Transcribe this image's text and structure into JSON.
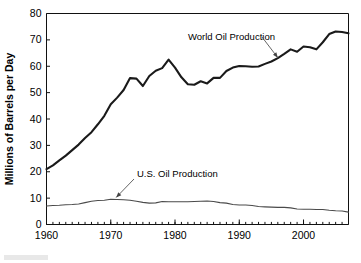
{
  "chart_data": {
    "type": "line",
    "title": "",
    "xlabel": "",
    "ylabel": "Millions of Barrels per Day",
    "xlim": [
      1960,
      2007
    ],
    "ylim": [
      0,
      80
    ],
    "ytick_values": [
      0,
      10,
      20,
      30,
      40,
      50,
      60,
      70,
      80
    ],
    "ytick_labels": [
      "0",
      "10",
      "20",
      "30",
      "40",
      "50",
      "60",
      "70",
      "80"
    ],
    "xtick_values": [
      1960,
      1970,
      1980,
      1990,
      2000
    ],
    "xtick_labels": [
      "1960",
      "1970",
      "1980",
      "1990",
      "2000"
    ],
    "minor_xticks_every": 1,
    "grid": false,
    "legend": "none",
    "x": [
      1960,
      1961,
      1962,
      1963,
      1964,
      1965,
      1966,
      1967,
      1968,
      1969,
      1970,
      1971,
      1972,
      1973,
      1974,
      1975,
      1976,
      1977,
      1978,
      1979,
      1980,
      1981,
      1982,
      1983,
      1984,
      1985,
      1986,
      1987,
      1988,
      1989,
      1990,
      1991,
      1992,
      1993,
      1994,
      1995,
      1996,
      1997,
      1998,
      1999,
      2000,
      2001,
      2002,
      2003,
      2004,
      2005,
      2006,
      2007
    ],
    "series": [
      {
        "name": "World Oil Production",
        "values": [
          21.0,
          22.4,
          24.3,
          26.1,
          28.2,
          30.3,
          32.8,
          35.0,
          38.0,
          41.2,
          45.6,
          48.1,
          51.0,
          55.5,
          55.3,
          52.5,
          56.3,
          58.3,
          59.3,
          62.5,
          59.5,
          55.8,
          53.2,
          53.0,
          54.3,
          53.5,
          55.6,
          55.6,
          58.2,
          59.5,
          60.1,
          60.0,
          59.8,
          59.9,
          60.9,
          61.8,
          63.1,
          64.7,
          66.4,
          65.5,
          67.5,
          67.2,
          66.4,
          69.1,
          72.2,
          73.2,
          73.0,
          72.5
        ]
      },
      {
        "name": "U.S. Oil Production",
        "values": [
          7.0,
          7.2,
          7.3,
          7.5,
          7.6,
          7.8,
          8.3,
          8.8,
          9.1,
          9.2,
          9.6,
          9.5,
          9.4,
          9.2,
          8.8,
          8.4,
          8.1,
          8.2,
          8.7,
          8.6,
          8.6,
          8.6,
          8.6,
          8.7,
          8.8,
          8.9,
          8.7,
          8.3,
          8.1,
          7.6,
          7.4,
          7.4,
          7.2,
          6.8,
          6.7,
          6.6,
          6.5,
          6.5,
          6.3,
          5.9,
          5.8,
          5.8,
          5.7,
          5.7,
          5.4,
          5.2,
          5.1,
          4.7
        ]
      }
    ],
    "annotations": [
      {
        "id": "world-annotation",
        "text": "World Oil Production",
        "points_to_year": 1996,
        "points_to_value": 64.0
      },
      {
        "id": "us-annotation",
        "text": "U.S. Oil Production",
        "points_to_year": 1971,
        "points_to_value": 9.5
      }
    ],
    "colors": {
      "world_line": "#1a1a1a",
      "us_line": "#4a4a4a",
      "axis": "#111111",
      "background": "#ffffff"
    }
  }
}
